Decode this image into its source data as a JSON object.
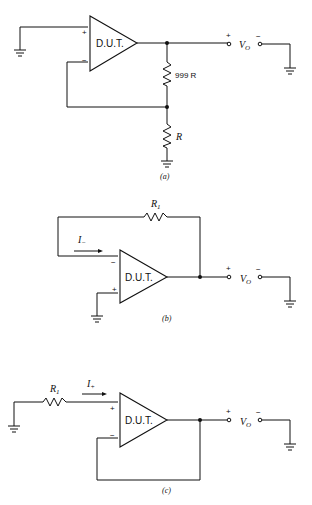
{
  "figure": {
    "panels": [
      {
        "id": "a",
        "caption": "(a)",
        "opamp_label": "D.U.T.",
        "plus_sign": "+",
        "minus_sign": "−",
        "resistor_top_label": "999 R",
        "resistor_bottom_label": "R",
        "output": {
          "plus": "+",
          "minus": "−",
          "label": "V",
          "label_sub": "O"
        }
      },
      {
        "id": "b",
        "caption": "(b)",
        "opamp_label": "D.U.T.",
        "plus_sign": "+",
        "minus_sign": "−",
        "resistor_label": "R",
        "resistor_label_sub": "1",
        "current_label": "I",
        "current_label_sub": "−",
        "output": {
          "plus": "+",
          "minus": "−",
          "label": "V",
          "label_sub": "O"
        }
      },
      {
        "id": "c",
        "caption": "(c)",
        "opamp_label": "D.U.T.",
        "plus_sign": "+",
        "minus_sign": "−",
        "resistor_label": "R",
        "resistor_label_sub": "1",
        "current_label": "I",
        "current_label_sub": "+",
        "output": {
          "plus": "+",
          "minus": "−",
          "label": "V",
          "label_sub": "O"
        }
      }
    ]
  }
}
